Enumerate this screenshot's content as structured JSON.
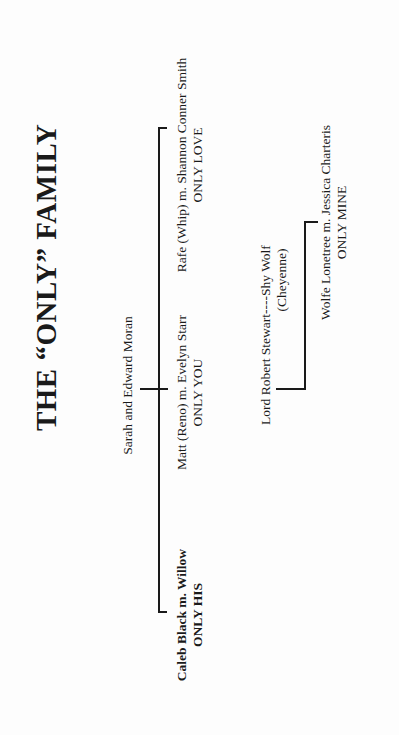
{
  "title": "THE “ONLY” FAMILY",
  "parents": {
    "name": "Sarah and Edward Moran"
  },
  "children": [
    {
      "name": "Caleb Black m. Willow",
      "book": "ONLY HIS",
      "bold": true
    },
    {
      "name": "Matt (Reno) m. Evelyn Starr",
      "book": "ONLY YOU",
      "bold": false
    },
    {
      "name": "Rafe (Whip) m. Shannon Conner Smith",
      "book": "ONLY LOVE",
      "bold": false
    }
  ],
  "second_branch": {
    "parent": {
      "name": "Lord Robert Stewart----Shy Wolf",
      "note": "(Cheyenne)"
    },
    "child": {
      "name": "Wolfe Lonetree m. Jessica Charteris",
      "book": "ONLY MINE"
    }
  }
}
